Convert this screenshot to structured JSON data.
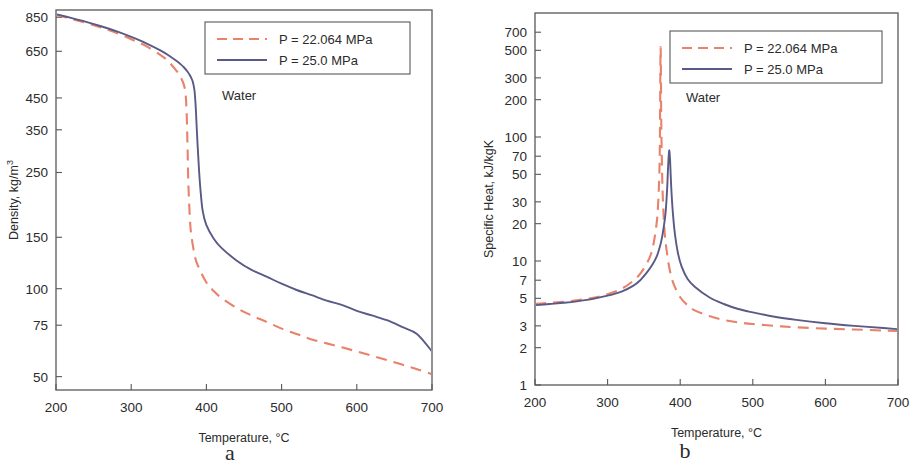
{
  "figure": {
    "subject": "Water",
    "panels": [
      {
        "id": "a",
        "letter": "a",
        "annotation": "Water",
        "xlabel_main": "Temperature, ",
        "xlabel_unit": "°C",
        "ylabel_main": "Density, kg/m",
        "ylabel_exp": "3",
        "legend": [
          {
            "label": "P = 22.064 MPa",
            "style": "dashed",
            "color": "#e8826a"
          },
          {
            "label": "P = 25.0     MPa",
            "style": "solid",
            "color": "#5a5a86"
          }
        ]
      },
      {
        "id": "b",
        "letter": "b",
        "annotation": "Water",
        "xlabel_main": "Temperature, ",
        "xlabel_unit": "°C",
        "ylabel_main": "Specific Heat, kJ/kgK",
        "ylabel_exp": "",
        "legend": [
          {
            "label": "P = 22.064 MPa",
            "style": "dashed",
            "color": "#e8826a"
          },
          {
            "label": "P = 25.0     MPa",
            "style": "solid",
            "color": "#5a5a86"
          }
        ]
      }
    ]
  },
  "chart_data": [
    {
      "type": "line",
      "panel": "a",
      "title": "",
      "annotation": "Water",
      "xlabel": "Temperature, °C",
      "ylabel": "Density, kg/m3",
      "xscale": "linear",
      "yscale": "log",
      "xlim": [
        200,
        700
      ],
      "ylim": [
        45,
        900
      ],
      "xticks": [
        200,
        300,
        400,
        500,
        600,
        700
      ],
      "yticks": [
        850,
        650,
        450,
        350,
        250,
        150,
        100,
        75,
        50
      ],
      "ytick_labels": [
        "850",
        "650",
        "450",
        "350",
        "250",
        "150",
        "100",
        "75",
        "50"
      ],
      "grid": false,
      "legend_position": "upper right",
      "series": [
        {
          "name": "P = 22.064 MPa",
          "style": "dashed",
          "color": "#e8826a",
          "x": [
            200,
            220,
            240,
            260,
            280,
            300,
            320,
            340,
            350,
            360,
            365,
            370,
            372,
            373,
            374,
            375,
            376,
            378,
            380,
            385,
            390,
            400,
            410,
            420,
            440,
            460,
            480,
            500,
            520,
            540,
            560,
            580,
            600,
            620,
            640,
            660,
            680,
            700
          ],
          "y": [
            866,
            840,
            813,
            784,
            752,
            715,
            677,
            628,
            598,
            558,
            535,
            500,
            470,
            440,
            380,
            300,
            230,
            175,
            152,
            128,
            118,
            105,
            98,
            93,
            86,
            81,
            77,
            73,
            70,
            67,
            65,
            63,
            61,
            59,
            57,
            55,
            53,
            51
          ]
        },
        {
          "name": "P = 25.0 MPa",
          "style": "solid",
          "color": "#5a5a86",
          "x": [
            200,
            220,
            240,
            260,
            280,
            300,
            320,
            340,
            350,
            360,
            365,
            370,
            375,
            378,
            380,
            382,
            384,
            385,
            386,
            388,
            390,
            392,
            395,
            400,
            410,
            420,
            440,
            460,
            480,
            500,
            520,
            540,
            560,
            580,
            600,
            620,
            640,
            660,
            680,
            700
          ],
          "y": [
            871,
            846,
            820,
            792,
            762,
            728,
            692,
            652,
            629,
            603,
            589,
            573,
            553,
            538,
            526,
            510,
            480,
            450,
            410,
            320,
            260,
            220,
            185,
            165,
            148,
            138,
            125,
            116,
            110,
            104,
            99,
            95,
            91,
            88,
            84,
            81,
            78,
            74,
            70,
            61
          ]
        }
      ]
    },
    {
      "type": "line",
      "panel": "b",
      "title": "",
      "annotation": "Water",
      "xlabel": "Temperature, °C",
      "ylabel": "Specific Heat, kJ/kgK",
      "xscale": "linear",
      "yscale": "log",
      "xlim": [
        200,
        700
      ],
      "ylim": [
        1,
        1000
      ],
      "xticks": [
        200,
        300,
        400,
        500,
        600,
        700
      ],
      "yticks": [
        700,
        500,
        300,
        200,
        100,
        70,
        50,
        30,
        20,
        10,
        7,
        5,
        3,
        2,
        1
      ],
      "ytick_labels": [
        "700",
        "500",
        "300",
        "200",
        "100",
        "70",
        "50",
        "30",
        "20",
        "10",
        "7",
        "5",
        "3",
        "2",
        "1"
      ],
      "grid": false,
      "legend_position": "upper right",
      "series": [
        {
          "name": "P = 22.064 MPa",
          "style": "dashed",
          "color": "#e8826a",
          "x": [
            200,
            220,
            240,
            260,
            280,
            300,
            320,
            335,
            345,
            355,
            360,
            364,
            367,
            369,
            371,
            372,
            373,
            374,
            375,
            376,
            378,
            380,
            384,
            388,
            392,
            400,
            410,
            420,
            440,
            460,
            480,
            500,
            530,
            560,
            600,
            640,
            680,
            700
          ],
          "y": [
            4.5,
            4.6,
            4.7,
            4.85,
            5.05,
            5.4,
            6.0,
            6.9,
            7.9,
            9.8,
            11.5,
            14.5,
            19,
            25,
            45,
            90,
            530,
            120,
            55,
            33,
            19,
            14,
            9.5,
            7.4,
            6.3,
            5.1,
            4.4,
            4.0,
            3.6,
            3.35,
            3.2,
            3.1,
            3.0,
            2.92,
            2.85,
            2.8,
            2.75,
            2.72
          ]
        },
        {
          "name": "P = 25.0 MPa",
          "style": "solid",
          "color": "#5a5a86",
          "x": [
            200,
            220,
            240,
            260,
            280,
            300,
            320,
            335,
            345,
            355,
            362,
            368,
            372,
            375,
            378,
            380,
            382,
            383,
            384,
            385,
            386,
            387,
            388,
            390,
            393,
            397,
            402,
            410,
            420,
            440,
            460,
            480,
            500,
            530,
            560,
            600,
            640,
            680,
            700
          ],
          "y": [
            4.4,
            4.5,
            4.6,
            4.75,
            4.95,
            5.25,
            5.7,
            6.3,
            7.0,
            8.2,
            9.4,
            11.0,
            13.0,
            15.5,
            20,
            25,
            38,
            52,
            68,
            78,
            66,
            48,
            36,
            24,
            16,
            11.5,
            9.0,
            7.2,
            6.2,
            5.1,
            4.5,
            4.1,
            3.85,
            3.55,
            3.35,
            3.15,
            3.0,
            2.88,
            2.82
          ]
        }
      ]
    }
  ]
}
